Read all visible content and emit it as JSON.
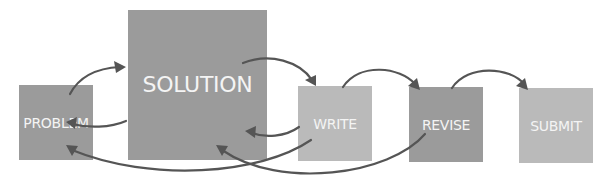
{
  "diagram": {
    "type": "process-flow",
    "nodes": [
      {
        "id": "problem",
        "label": "PROBLEM",
        "shade": "dark"
      },
      {
        "id": "solution",
        "label": "SOLUTION",
        "shade": "dark"
      },
      {
        "id": "write",
        "label": "WRITE",
        "shade": "light"
      },
      {
        "id": "revise",
        "label": "REVISE",
        "shade": "dark"
      },
      {
        "id": "submit",
        "label": "SUBMIT",
        "shade": "light"
      }
    ],
    "edges": [
      {
        "from": "problem",
        "to": "solution"
      },
      {
        "from": "solution",
        "to": "problem"
      },
      {
        "from": "solution",
        "to": "write"
      },
      {
        "from": "write",
        "to": "solution"
      },
      {
        "from": "write",
        "to": "problem"
      },
      {
        "from": "write",
        "to": "revise"
      },
      {
        "from": "revise",
        "to": "solution"
      },
      {
        "from": "revise",
        "to": "submit"
      }
    ],
    "colors": {
      "dark_box": "#9b9b9b",
      "light_box": "#bababa",
      "arrow": "#555555",
      "label": "#f4f4f4"
    }
  }
}
